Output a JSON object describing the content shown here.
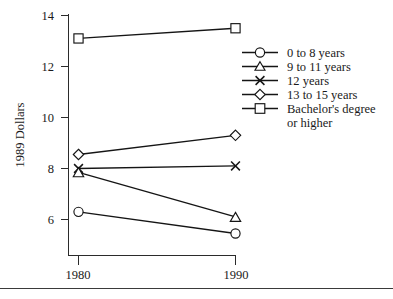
{
  "chart_data": {
    "type": "line",
    "title": "",
    "xlabel": "",
    "ylabel": "1989 Dollars",
    "x": [
      1980,
      1990
    ],
    "xtick_labels": [
      "1980",
      "1990"
    ],
    "ytick_labels": [
      "6",
      "8",
      "10",
      "12",
      "14"
    ],
    "yticks": [
      6,
      8,
      10,
      12,
      14
    ],
    "ylim": [
      4.6,
      14.0
    ],
    "xlim": [
      1978.6,
      1991.0
    ],
    "grid": false,
    "legend_position": "right",
    "series": [
      {
        "name": "0 to 8 years",
        "marker": "circle",
        "values": [
          6.3,
          5.45
        ]
      },
      {
        "name": "9 to 11 years",
        "marker": "triangle",
        "values": [
          7.85,
          6.1
        ]
      },
      {
        "name": "12 years",
        "marker": "x",
        "values": [
          8.0,
          8.1
        ]
      },
      {
        "name": "13 to 15 years",
        "marker": "diamond",
        "values": [
          8.55,
          9.3
        ]
      },
      {
        "name": "Bachelor's degree or higher",
        "marker": "square",
        "values": [
          13.1,
          13.5
        ]
      }
    ]
  },
  "axes": {
    "y_title": "1989 Dollars",
    "y_tick_0": "6",
    "y_tick_1": "8",
    "y_tick_2": "10",
    "y_tick_3": "12",
    "y_tick_4": "14",
    "x_tick_0": "1980",
    "x_tick_1": "1990"
  },
  "legend": {
    "entries": [
      {
        "label": "0 to 8 years",
        "marker": "circle-marker"
      },
      {
        "label": "9 to 11 years",
        "marker": "triangle-marker"
      },
      {
        "label": "12 years",
        "marker": "x-marker"
      },
      {
        "label": "13 to 15 years",
        "marker": "diamond-marker"
      },
      {
        "label_line1": "Bachelor's degree",
        "label_line2": "or higher",
        "marker": "square-marker"
      }
    ],
    "entry_0_label": "0 to 8 years",
    "entry_1_label": "9 to 11 years",
    "entry_2_label": "12 years",
    "entry_3_label": "13 to 15 years",
    "entry_4_label_line1": "Bachelor's degree",
    "entry_4_label_line2": "or higher"
  },
  "colors": {
    "ink": "#151515",
    "axis": "#2b2b2b",
    "background": "#ffffff"
  }
}
